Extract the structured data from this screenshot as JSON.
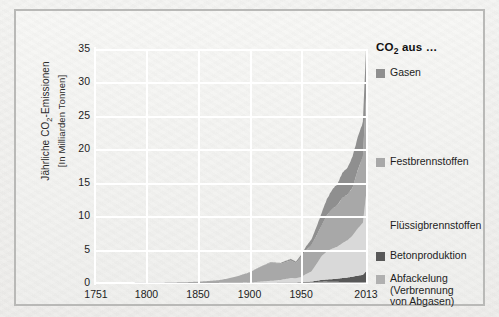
{
  "chart_data": {
    "type": "area",
    "title": "",
    "xlabel": "",
    "ylabel_line1": "Jährliche CO₂-Emissionen",
    "ylabel_line2": "[In Milliarden Tonnen]",
    "legend_title": "CO₂ aus …",
    "legend_position": "right",
    "grid": true,
    "stacked": true,
    "xlim": [
      1751,
      2013
    ],
    "ylim": [
      0,
      35
    ],
    "xticks": [
      1751,
      1800,
      1850,
      1900,
      1950,
      2013
    ],
    "xtick_labels": [
      "1751",
      "1800",
      "1850",
      "1900",
      "1950",
      "2013"
    ],
    "yticks": [
      0,
      5,
      10,
      15,
      20,
      25,
      30,
      35
    ],
    "ytick_labels": [
      "0",
      "5",
      "10",
      "15",
      "20",
      "25",
      "30",
      "35"
    ],
    "colors": {
      "gas": "#8f8f8f",
      "solid": "#a8a8a8",
      "liquid": "#d9d9d9",
      "cement": "#585858",
      "flaring": "#b0b0b0",
      "grid": "#ffffff",
      "frame": "#b9b9b7",
      "background": "#f4f4f2",
      "text": "#1d1d1d"
    },
    "series": [
      {
        "name": "Abfackelung (Verbrennung von Abgasen)",
        "key": "flaring",
        "color": "#b0b0b0",
        "x": [
          1751,
          1800,
          1850,
          1900,
          1925,
          1950,
          1960,
          1970,
          1980,
          1990,
          2000,
          2013
        ],
        "values": [
          0,
          0,
          0,
          0.01,
          0.02,
          0.05,
          0.1,
          0.2,
          0.18,
          0.15,
          0.12,
          0.15
        ]
      },
      {
        "name": "Betonproduktion",
        "key": "cement",
        "color": "#585858",
        "x": [
          1751,
          1800,
          1850,
          1900,
          1925,
          1950,
          1960,
          1970,
          1980,
          1990,
          2000,
          2013
        ],
        "values": [
          0,
          0,
          0,
          0.01,
          0.03,
          0.06,
          0.12,
          0.25,
          0.35,
          0.55,
          0.8,
          1.6
        ]
      },
      {
        "name": "Flüssigbrennstoffen",
        "key": "liquid",
        "color": "#d9d9d9",
        "x": [
          1751,
          1800,
          1850,
          1870,
          1900,
          1925,
          1950,
          1960,
          1970,
          1980,
          1990,
          2000,
          2013
        ],
        "values": [
          0,
          0,
          0,
          0.01,
          0.05,
          0.3,
          0.8,
          1.5,
          3.5,
          4.2,
          5.0,
          6.0,
          11.2
        ]
      },
      {
        "name": "Festbrennstoffen",
        "key": "solid",
        "color": "#a8a8a8",
        "x": [
          1751,
          1800,
          1850,
          1870,
          1900,
          1920,
          1930,
          1945,
          1950,
          1960,
          1970,
          1980,
          1990,
          2000,
          2013
        ],
        "values": [
          0.003,
          0.03,
          0.2,
          0.4,
          1.5,
          2.5,
          2.4,
          2.5,
          3.0,
          4.0,
          4.5,
          5.5,
          6.5,
          7.0,
          14.5
        ]
      },
      {
        "name": "Gasen",
        "key": "gas",
        "color": "#8f8f8f",
        "x": [
          1751,
          1800,
          1850,
          1900,
          1925,
          1950,
          1960,
          1970,
          1980,
          1990,
          2000,
          2013
        ],
        "values": [
          0,
          0,
          0,
          0.01,
          0.06,
          0.3,
          0.8,
          1.8,
          2.6,
          3.5,
          4.5,
          7.2
        ]
      }
    ],
    "stack_totals": {
      "x": [
        1751,
        1780,
        1800,
        1820,
        1840,
        1850,
        1860,
        1870,
        1880,
        1890,
        1900,
        1910,
        1920,
        1930,
        1940,
        1945,
        1950,
        1955,
        1960,
        1965,
        1970,
        1975,
        1980,
        1985,
        1990,
        1995,
        2000,
        2005,
        2010,
        2013
      ],
      "values": [
        0.003,
        0.01,
        0.03,
        0.06,
        0.13,
        0.2,
        0.3,
        0.42,
        0.7,
        1.1,
        1.6,
        2.4,
        3.1,
        3.0,
        3.6,
        3.2,
        4.2,
        5.5,
        6.5,
        8.4,
        10.5,
        12.5,
        13.9,
        14.8,
        16.4,
        17.3,
        18.9,
        21.8,
        24.1,
        35.0
      ]
    }
  },
  "legend_items": [
    {
      "label": "Gasen",
      "swatch": "#8f8f8f",
      "has_swatch": true,
      "top": 32
    },
    {
      "label": "Festbrennstoffen",
      "swatch": "#a8a8a8",
      "has_swatch": true,
      "top": 121
    },
    {
      "label": "Flüssigbrennstoffen",
      "swatch": "#d9d9d9",
      "has_swatch": false,
      "top": 185
    },
    {
      "label": "Betonproduktion",
      "swatch": "#585858",
      "has_swatch": true,
      "top": 215
    },
    {
      "label": "Abfackelung\n(Verbrennung\nvon Abgasen)",
      "swatch": "#b0b0b0",
      "has_swatch": true,
      "top": 238
    }
  ]
}
